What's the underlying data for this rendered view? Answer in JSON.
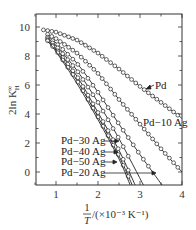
{
  "chart_data": {
    "type": "line",
    "title": "",
    "xlabel": "1/T /(×10⁻³ K⁻¹)",
    "ylabel": "2ln K_H^∞",
    "xlim": [
      0.5,
      4
    ],
    "ylim": [
      -1,
      10.8
    ],
    "xticks": [
      1,
      2,
      3,
      4
    ],
    "yticks": [
      0,
      2,
      4,
      6,
      8,
      10
    ],
    "grid": false,
    "legend": "inline labels with arrows",
    "series": [
      {
        "name": "Pd",
        "label_pos": [
          2.95,
          6.0
        ],
        "arrow_to": [
          2.75,
          5.6
        ],
        "x": [
          0.7,
          1.0,
          1.5,
          2.0,
          2.5,
          3.0,
          3.5,
          4.0
        ],
        "y": [
          9.8,
          9.65,
          9.1,
          8.2,
          7.1,
          5.9,
          4.8,
          3.7
        ]
      },
      {
        "name": "Pd-10 Ag",
        "label_pos": [
          3.15,
          3.5
        ],
        "x": [
          0.8,
          1.0,
          1.5,
          2.0,
          2.5,
          3.0,
          3.5,
          4.0
        ],
        "y": [
          9.5,
          9.2,
          8.2,
          6.8,
          5.0,
          3.3,
          1.6,
          0.0
        ]
      },
      {
        "name": "Pd-20 Ag",
        "label_pos": [
          1.1,
          0.0
        ],
        "arrow_to": [
          3.35,
          0.0
        ],
        "x": [
          0.8,
          1.0,
          1.5,
          2.0,
          2.5,
          3.0,
          3.55
        ],
        "y": [
          9.3,
          8.9,
          7.5,
          5.5,
          3.3,
          1.2,
          -1.0
        ]
      },
      {
        "name": "Pd-30 Ag",
        "label_pos": [
          1.1,
          2.2
        ],
        "arrow_to": [
          2.45,
          2.2
        ],
        "x": [
          0.8,
          1.0,
          1.5,
          2.0,
          2.5,
          3.1
        ],
        "y": [
          9.2,
          8.7,
          7.0,
          4.8,
          2.3,
          -1.0
        ]
      },
      {
        "name": "Pd-40 Ag",
        "label_pos": [
          1.1,
          1.4
        ],
        "arrow_to": [
          2.45,
          1.4
        ],
        "x": [
          0.8,
          1.0,
          1.5,
          2.0,
          2.5,
          2.9
        ],
        "y": [
          9.1,
          8.5,
          6.6,
          4.1,
          1.5,
          -1.0
        ]
      },
      {
        "name": "Pd-50 Ag",
        "label_pos": [
          1.1,
          0.7
        ],
        "arrow_to": [
          2.4,
          0.7
        ],
        "x": [
          0.8,
          1.0,
          1.5,
          2.0,
          2.5,
          2.83
        ],
        "y": [
          9.05,
          8.4,
          6.3,
          3.8,
          1.1,
          -1.0
        ]
      }
    ]
  },
  "axis": {
    "y_title_main": "2ln K",
    "y_title_sup": "∞",
    "y_title_sub": "H",
    "x_title_num": "1",
    "x_title_den": "T",
    "x_title_unit": "/(×10⁻³ K⁻¹)",
    "x_ticks": [
      "1",
      "2",
      "3",
      "4"
    ],
    "y_ticks": [
      "0",
      "2",
      "4",
      "6",
      "8",
      "10"
    ]
  },
  "labels": {
    "pd": "Pd",
    "pd10": "Pd−10 Ag",
    "pd20": "Pd−20 Ag",
    "pd30": "Pd−30 Ag",
    "pd40": "Pd−40 Ag",
    "pd50": "Pd−50 Ag"
  }
}
